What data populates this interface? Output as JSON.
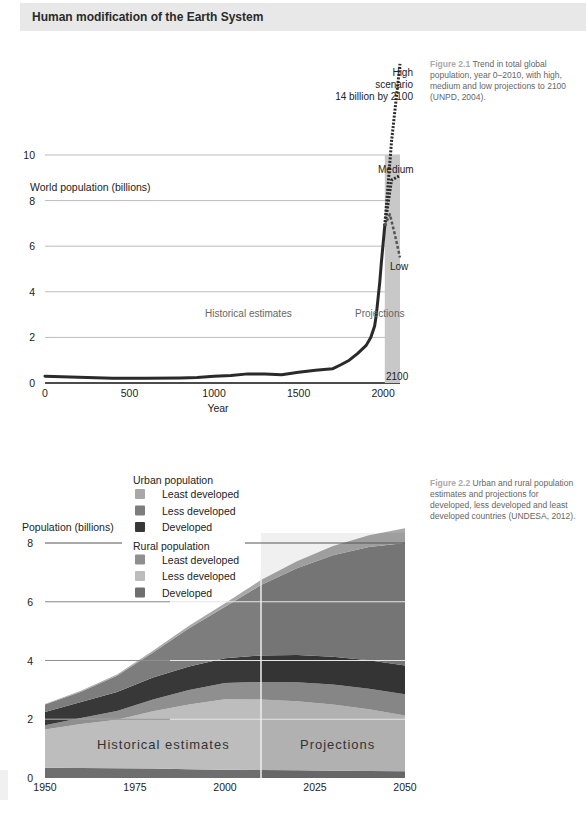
{
  "header": {
    "title": "Human modification of the Earth System"
  },
  "figure1": {
    "caption_label": "Figure 2.1",
    "caption_text": "Trend in total global population, year 0–2010, with high, medium and low projections to 2100 (UNPD, 2004).",
    "annotations": {
      "high_line1": "High",
      "high_line2": "scenario",
      "high_line3": "14 billion by 2100",
      "medium": "Medium",
      "low": "Low",
      "historical": "Historical estimates",
      "projections": "Projections",
      "end_year": "2100"
    }
  },
  "figure2": {
    "caption_label": "Figure 2.2",
    "caption_text": "Urban and rural population estimates and projections for developed, less developed and least developed countries (UNDESA, 2012).",
    "annotations": {
      "historical": "Historical estimates",
      "projections": "Projections"
    }
  },
  "chart_data": [
    {
      "type": "line",
      "title": "World population (billions)",
      "xlabel": "Year",
      "ylabel": "World population (billions)",
      "xlim": [
        0,
        2100
      ],
      "ylim": [
        0,
        10
      ],
      "xticks": [
        0,
        500,
        1000,
        1500,
        2000
      ],
      "yticks": [
        0,
        2,
        4,
        6,
        8,
        10
      ],
      "grid": true,
      "projection_band": [
        2010,
        2100
      ],
      "series": [
        {
          "name": "Historical",
          "style": "solid",
          "x": [
            0,
            200,
            400,
            600,
            800,
            900,
            1000,
            1100,
            1200,
            1300,
            1400,
            1500,
            1600,
            1700,
            1750,
            1800,
            1850,
            1900,
            1927,
            1950,
            1960,
            1970,
            1980,
            1990,
            2000,
            2010
          ],
          "y": [
            0.3,
            0.25,
            0.21,
            0.21,
            0.22,
            0.24,
            0.3,
            0.33,
            0.4,
            0.4,
            0.36,
            0.47,
            0.56,
            0.62,
            0.8,
            1.0,
            1.3,
            1.65,
            2.0,
            2.5,
            3.0,
            3.7,
            4.4,
            5.3,
            6.1,
            6.9
          ]
        },
        {
          "name": "High scenario",
          "style": "dotted",
          "x": [
            2010,
            2050,
            2100
          ],
          "y": [
            6.9,
            10.6,
            14.0
          ]
        },
        {
          "name": "Medium",
          "style": "dotted",
          "x": [
            2010,
            2050,
            2075,
            2100
          ],
          "y": [
            6.9,
            8.9,
            9.0,
            9.1
          ]
        },
        {
          "name": "Low",
          "style": "dashed",
          "x": [
            2010,
            2040,
            2070,
            2100
          ],
          "y": [
            6.9,
            7.4,
            6.5,
            5.5
          ]
        }
      ]
    },
    {
      "type": "area",
      "title": "",
      "xlabel": "",
      "ylabel": "Population (billions)",
      "xlim": [
        1950,
        2050
      ],
      "ylim": [
        0,
        8
      ],
      "xticks": [
        1950,
        1975,
        2000,
        2025,
        2050
      ],
      "yticks": [
        0,
        2,
        4,
        6,
        8
      ],
      "grid": true,
      "projection_start": 2010,
      "legend": {
        "groups": [
          {
            "title": "Urban population",
            "items": [
              "Least developed",
              "Less developed",
              "Developed"
            ]
          },
          {
            "title": "Rural population",
            "items": [
              "Least developed",
              "Less developed",
              "Developed"
            ]
          }
        ],
        "placement": "top-left"
      },
      "x": [
        1950,
        1960,
        1970,
        1980,
        1990,
        2000,
        2010,
        2020,
        2030,
        2040,
        2050
      ],
      "series": [
        {
          "name": "Rural Developed",
          "color": "#6e6e6e",
          "values": [
            0.35,
            0.34,
            0.33,
            0.32,
            0.3,
            0.28,
            0.27,
            0.26,
            0.25,
            0.24,
            0.23
          ]
        },
        {
          "name": "Rural Less developed",
          "color": "#bdbdbd",
          "values": [
            1.3,
            1.5,
            1.65,
            1.95,
            2.2,
            2.4,
            2.4,
            2.35,
            2.25,
            2.1,
            1.9
          ]
        },
        {
          "name": "Rural Least developed",
          "color": "#8f8f8f",
          "values": [
            0.15,
            0.2,
            0.3,
            0.4,
            0.5,
            0.55,
            0.6,
            0.65,
            0.68,
            0.7,
            0.72
          ]
        },
        {
          "name": "Urban Developed",
          "color": "#383838",
          "values": [
            0.45,
            0.55,
            0.65,
            0.75,
            0.8,
            0.85,
            0.9,
            0.93,
            0.95,
            0.97,
            0.98
          ]
        },
        {
          "name": "Urban Less developed",
          "color": "#7d7d7d",
          "values": [
            0.25,
            0.35,
            0.55,
            0.85,
            1.3,
            1.75,
            2.4,
            2.95,
            3.45,
            3.85,
            4.17
          ]
        },
        {
          "name": "Urban Least developed",
          "color": "#a8a8a8",
          "values": [
            0.02,
            0.03,
            0.04,
            0.06,
            0.08,
            0.12,
            0.17,
            0.24,
            0.32,
            0.4,
            0.5
          ]
        }
      ]
    }
  ]
}
